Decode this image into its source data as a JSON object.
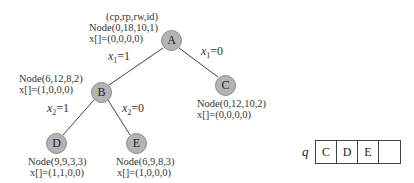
{
  "header_label": "(cp,rp,rw,id)",
  "nodes": {
    "A": {
      "name": "A",
      "node": "Node(0,18,10,1)",
      "x": "x[]=(0,0,0,0)"
    },
    "B": {
      "name": "B",
      "node": "Node(6,12,8,2)",
      "x": "x[]=(1,0,0,0)"
    },
    "C": {
      "name": "C",
      "node": "Node(0,12,10,2)",
      "x": "x[]=(0,0,0,0)"
    },
    "D": {
      "name": "D",
      "node": "Node(9,9,3,3)",
      "x": "x[]=(1,1,0,0)"
    },
    "E": {
      "name": "E",
      "node": "Node(6,9,8,3)",
      "x": "x[]=(1,0,0,0)"
    }
  },
  "edges": {
    "AB": {
      "var": "x",
      "sub": "1",
      "val": "=1"
    },
    "AC": {
      "var": "x",
      "sub": "1",
      "val": "=0"
    },
    "BD": {
      "var": "x",
      "sub": "2",
      "val": "=1"
    },
    "BE": {
      "var": "x",
      "sub": "2",
      "val": "=0"
    }
  },
  "queue": {
    "label": "q",
    "cells": [
      "C",
      "D",
      "E",
      ""
    ]
  },
  "colors": {
    "node_fill": "#b4b4b4",
    "node_stroke": "#8a8a8a",
    "edge": "#444444"
  }
}
